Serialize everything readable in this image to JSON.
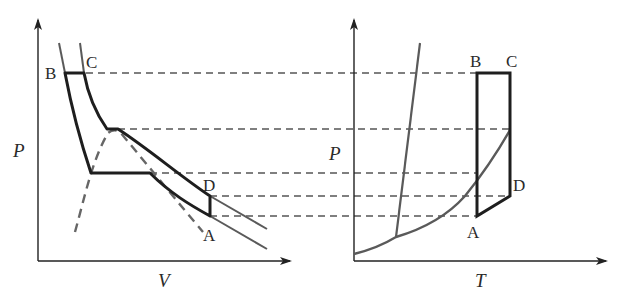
{
  "figure": {
    "colors": {
      "axis": "#222222",
      "cycle": "#1e1e1e",
      "isotherm": "#5a5a5a",
      "dashed": "#555555",
      "background": "#ffffff"
    },
    "pv_diagram": {
      "x_axis_label": "V",
      "y_axis_label": "P",
      "points": {
        "A": "A",
        "B": "B",
        "C": "C",
        "D": "D"
      },
      "curves": [
        "cycle ABCD",
        "isotherm through B",
        "isotherm through C/D",
        "isotherm through A",
        "saturation dome (dashed)"
      ]
    },
    "pt_diagram": {
      "x_axis_label": "T",
      "y_axis_label": "P",
      "points": {
        "A": "A",
        "B": "B",
        "C": "C",
        "D": "D"
      },
      "curves": [
        "cycle ABCD (rectangle-like)",
        "vapor pressure curve",
        "melting curve"
      ]
    },
    "guide_lines": {
      "count": 5,
      "style": "dashed",
      "levels": [
        "P_B = P_C",
        "P_critical",
        "P_sat at T_A",
        "P_D",
        "P_A"
      ]
    }
  }
}
